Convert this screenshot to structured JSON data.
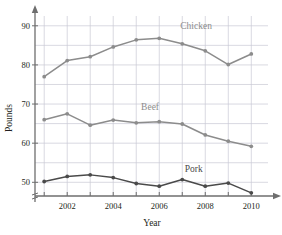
{
  "chart_data": {
    "type": "line",
    "title": "",
    "xlabel": "Year",
    "ylabel": "Pounds",
    "x": [
      2001,
      2002,
      2003,
      2004,
      2005,
      2006,
      2007,
      2008,
      2009,
      2010
    ],
    "xtick_labels": [
      "2002",
      "2004",
      "2006",
      "2008",
      "2010"
    ],
    "xticks": [
      2002,
      2004,
      2006,
      2008,
      2010
    ],
    "ytick_labels": [
      "50",
      "60",
      "70",
      "80",
      "90"
    ],
    "yticks": [
      50,
      60,
      70,
      80,
      90
    ],
    "xlim": [
      2000.6,
      2010.9
    ],
    "ylim": [
      46.5,
      92.5
    ],
    "grid": true,
    "grid_minor_step": 5,
    "axis_break": true,
    "legend_position": "inline-annotations",
    "series": [
      {
        "name": "Chicken",
        "color": "#8c8c8c",
        "label_x": 2007.6,
        "label_y": 89.2,
        "values": [
          77.0,
          81.1,
          82.1,
          84.6,
          86.4,
          86.8,
          85.4,
          83.6,
          80.1,
          82.8
        ]
      },
      {
        "name": "Beef",
        "color": "#8c8c8c",
        "label_x": 2005.6,
        "label_y": 68.6,
        "values": [
          66.0,
          67.5,
          64.6,
          65.9,
          65.2,
          65.5,
          64.9,
          62.1,
          60.5,
          59.2
        ]
      },
      {
        "name": "Pork",
        "color": "#4a4a4a",
        "label_x": 2007.5,
        "label_y": 52.6,
        "values": [
          50.2,
          51.5,
          51.9,
          51.2,
          49.7,
          49.0,
          50.7,
          49.0,
          49.8,
          47.3
        ]
      }
    ]
  },
  "colors": {
    "grid": "#c9c9d4",
    "axis": "#6e6e6e",
    "chicken": "#8c8c8c",
    "beef": "#8c8c8c",
    "pork": "#4a4a4a",
    "text": "#231f20",
    "background": "#ffffff"
  }
}
